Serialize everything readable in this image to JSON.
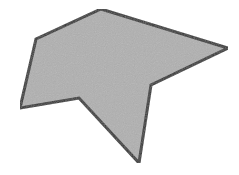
{
  "diagram": {
    "type": "polygon",
    "shape": "irregular concave heptagon",
    "fill": "#b0b0b0",
    "stroke": "#333333",
    "stroke_width": 3,
    "vertices": [
      [
        101,
        9
      ],
      [
        228,
        48
      ],
      [
        151,
        85
      ],
      [
        139,
        163
      ],
      [
        79,
        98
      ],
      [
        20,
        108
      ],
      [
        36,
        39
      ]
    ]
  }
}
